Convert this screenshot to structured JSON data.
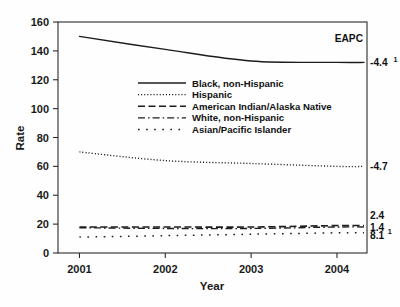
{
  "chart_data": {
    "type": "line",
    "title": "",
    "xlabel": "Year",
    "ylabel": "Rate",
    "x": [
      2001,
      2002,
      2003,
      2004
    ],
    "xlim": [
      2000.75,
      2004.35
    ],
    "ylim": [
      0,
      160
    ],
    "xticks": [
      "2001",
      "2002",
      "2003",
      "2004"
    ],
    "yticks": [
      "0",
      "20",
      "40",
      "60",
      "80",
      "100",
      "120",
      "140",
      "160"
    ],
    "grid": false,
    "legend_position": "upper-center-inside",
    "annotation_column_header": "EAPC",
    "series": [
      {
        "name": "Black, non-Hispanic",
        "values": [
          150,
          141,
          133,
          132
        ],
        "linestyle": "solid",
        "eapc": "-4.4",
        "eapc_superscript": "1"
      },
      {
        "name": "Hispanic",
        "values": [
          70,
          64,
          62,
          60
        ],
        "linestyle": "dotted-fine",
        "eapc": "-4.7",
        "eapc_superscript": ""
      },
      {
        "name": "American Indian/Alaska Native",
        "values": [
          18,
          18,
          18,
          19
        ],
        "linestyle": "dashed",
        "eapc": "2.4",
        "eapc_superscript": ""
      },
      {
        "name": "White, non-Hispanic",
        "values": [
          17.5,
          17,
          17,
          18
        ],
        "linestyle": "dash-dot",
        "eapc": "1.4",
        "eapc_superscript": ""
      },
      {
        "name": "Asian/Pacific Islander",
        "values": [
          11,
          12,
          13,
          14
        ],
        "linestyle": "dotted-sparse",
        "eapc": "8.1",
        "eapc_superscript": "1"
      }
    ]
  },
  "axes": {
    "y_title": "Rate",
    "x_title": "Year",
    "y_tick_labels": [
      "160",
      "140",
      "120",
      "100",
      "80",
      "60",
      "40",
      "20",
      "0"
    ],
    "x_tick_labels": [
      "2001",
      "2002",
      "2003",
      "2004"
    ]
  },
  "legend": {
    "items": [
      {
        "label": "Black, non-Hispanic"
      },
      {
        "label": "Hispanic"
      },
      {
        "label": "American Indian/Alaska Native"
      },
      {
        "label": "White, non-Hispanic"
      },
      {
        "label": "Asian/Pacific Islander"
      }
    ]
  },
  "annotations": {
    "header": "EAPC",
    "values": [
      {
        "text": "-4.4",
        "sup": "1"
      },
      {
        "text": "-4.7",
        "sup": ""
      },
      {
        "text": "2.4",
        "sup": ""
      },
      {
        "text": "1.4",
        "sup": ""
      },
      {
        "text": "8.1",
        "sup": "1"
      }
    ]
  },
  "colors": {
    "ink": "#1c1c1c",
    "background": "#ffffff"
  }
}
